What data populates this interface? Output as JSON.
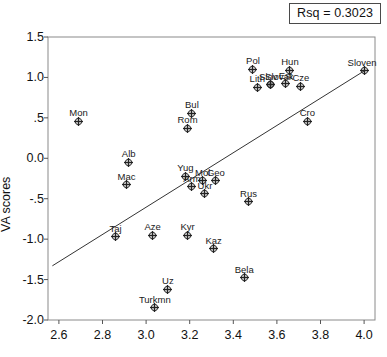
{
  "annotation": {
    "rsq_label": "Rsq = 0.3023"
  },
  "axes": {
    "ylabel": "VA scores",
    "xticks": [
      "2.6",
      "2.8",
      "3.0",
      "3.2",
      "3.4",
      "3.6",
      "3.8",
      "4.0"
    ],
    "yticks": [
      "1.5",
      "1.0",
      ".5",
      "0.0",
      "-.5",
      "-1.0",
      "-1.5",
      "-2.0"
    ]
  },
  "chart_data": {
    "type": "scatter",
    "title": "",
    "xlabel": "",
    "ylabel": "VA scores",
    "xlim": [
      2.55,
      4.05
    ],
    "ylim": [
      -2.0,
      1.5
    ],
    "xticks": [
      2.6,
      2.8,
      3.0,
      3.2,
      3.4,
      3.6,
      3.8,
      4.0
    ],
    "yticks": [
      1.5,
      1.0,
      0.5,
      0.0,
      -0.5,
      -1.0,
      -1.5,
      -2.0
    ],
    "grid": false,
    "legend": null,
    "annotations": [
      {
        "text": "Rsq = 0.3023",
        "position": "top-right",
        "boxed": true
      }
    ],
    "regression_line": {
      "x": [
        2.57,
        4.0
      ],
      "y": [
        -1.33,
        1.08
      ]
    },
    "point_label_key": "country",
    "points": [
      {
        "country": "Mon",
        "x": 2.69,
        "y": 0.46,
        "label_dx": 0,
        "label_dy": -9
      },
      {
        "country": "Alb",
        "x": 2.92,
        "y": -0.05,
        "label_dx": 0,
        "label_dy": -9
      },
      {
        "country": "Mac",
        "x": 2.91,
        "y": -0.33,
        "label_dx": 0,
        "label_dy": -9
      },
      {
        "country": "Taj",
        "x": 2.86,
        "y": -0.97,
        "label_dx": 0,
        "label_dy": -9
      },
      {
        "country": "Aze",
        "x": 3.03,
        "y": -0.95,
        "label_dx": 0,
        "label_dy": -9
      },
      {
        "country": "Turkmn",
        "x": 3.04,
        "y": -1.85,
        "label_dx": 0,
        "label_dy": -9
      },
      {
        "country": "Uz",
        "x": 3.1,
        "y": -1.62,
        "label_dx": 0,
        "label_dy": -9
      },
      {
        "country": "Kyr",
        "x": 3.19,
        "y": -0.95,
        "label_dx": 0,
        "label_dy": -9
      },
      {
        "country": "Yug",
        "x": 3.18,
        "y": -0.22,
        "label_dx": 0,
        "label_dy": -9
      },
      {
        "country": "Arm",
        "x": 3.21,
        "y": -0.35,
        "label_dx": 0,
        "label_dy": -9
      },
      {
        "country": "Bul",
        "x": 3.21,
        "y": 0.56,
        "label_dx": 0,
        "label_dy": -9
      },
      {
        "country": "Rom",
        "x": 3.19,
        "y": 0.37,
        "label_dx": 0,
        "label_dy": -9
      },
      {
        "country": "Mol",
        "x": 3.26,
        "y": -0.28,
        "label_dx": 0,
        "label_dy": -9
      },
      {
        "country": "Geo",
        "x": 3.32,
        "y": -0.28,
        "label_dx": 0,
        "label_dy": -9
      },
      {
        "country": "Ukr",
        "x": 3.27,
        "y": -0.44,
        "label_dx": 0,
        "label_dy": -9
      },
      {
        "country": "Kaz",
        "x": 3.31,
        "y": -1.12,
        "label_dx": 0,
        "label_dy": -9
      },
      {
        "country": "Bela",
        "x": 3.45,
        "y": -1.48,
        "label_dx": 0,
        "label_dy": -9
      },
      {
        "country": "Rus",
        "x": 3.47,
        "y": -0.54,
        "label_dx": 0,
        "label_dy": -9
      },
      {
        "country": "Pol",
        "x": 3.49,
        "y": 1.1,
        "label_dx": 0,
        "label_dy": -9
      },
      {
        "country": "Lith",
        "x": 3.51,
        "y": 0.88,
        "label_dx": 0,
        "label_dy": -9
      },
      {
        "country": "Slov",
        "x": 3.57,
        "y": 0.91,
        "label_dx": -2,
        "label_dy": -9
      },
      {
        "country": "Slovak",
        "x": 3.57,
        "y": 0.91,
        "label_dx": 9,
        "label_dy": -9
      },
      {
        "country": "Est",
        "x": 3.64,
        "y": 0.92,
        "label_dx": 0,
        "label_dy": -9
      },
      {
        "country": "Hun",
        "x": 3.66,
        "y": 1.09,
        "label_dx": 0,
        "label_dy": -9
      },
      {
        "country": "Cze",
        "x": 3.71,
        "y": 0.89,
        "label_dx": 0,
        "label_dy": -9
      },
      {
        "country": "Cro",
        "x": 3.74,
        "y": 0.46,
        "label_dx": 0,
        "label_dy": -9
      },
      {
        "country": "Sloven",
        "x": 4.0,
        "y": 1.08,
        "label_dx": -2,
        "label_dy": -9
      }
    ]
  }
}
